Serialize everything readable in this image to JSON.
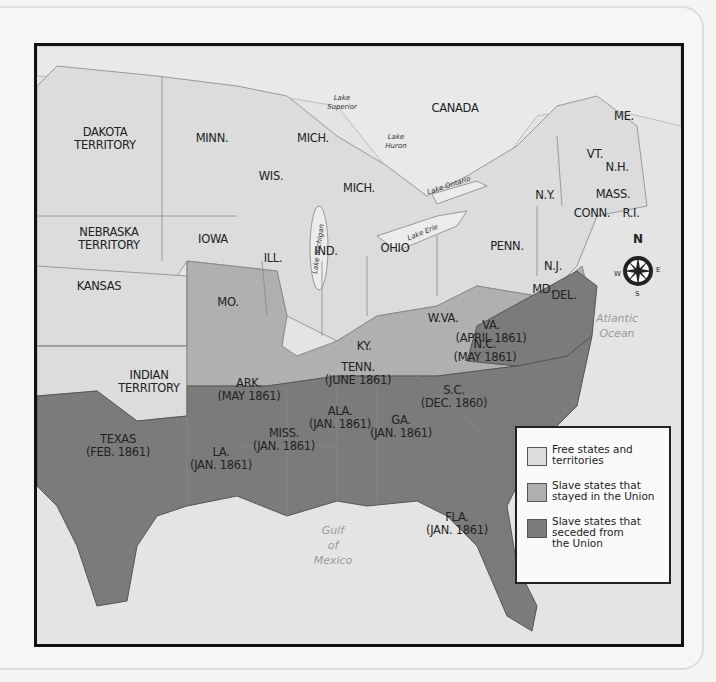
{
  "colors": {
    "free": "#dcdcdc",
    "slave_union": "#b0b0b0",
    "slave_seceded": "#7b7b7b",
    "water": "#e6e6e6",
    "canada": "#e8e8e8",
    "border": "#111111"
  },
  "labels": {
    "canada": "CANADA",
    "dakota": "DAKOTA\nTERRITORY",
    "minn": "MINN.",
    "mich_upper": "MICH.",
    "mich_lower": "MICH.",
    "wis": "WIS.",
    "nebraska": "NEBRASKA\nTERRITORY",
    "iowa": "IOWA",
    "ill": "ILL.",
    "ind": "IND.",
    "ohio": "OHIO",
    "penn": "PENN.",
    "ny": "N.Y.",
    "vt": "VT.",
    "nh": "N.H.",
    "me": "ME.",
    "mass": "MASS.",
    "conn": "CONN.",
    "ri": "R.I.",
    "nj": "N.J.",
    "del": "DEL.",
    "md": "MD.",
    "kansas": "KANSAS",
    "mo": "MO.",
    "ky": "KY.",
    "wva": "W.VA.",
    "va": "VA.\n(APRIL 1861)",
    "nc": "N.C.\n(MAY 1861)",
    "tenn": "TENN.\n(JUNE 1861)",
    "ark": "ARK.\n(MAY 1861)",
    "indian": "INDIAN\nTERRITORY",
    "sc": "S.C.\n(DEC. 1860)",
    "ala": "ALA.\n(JAN. 1861)",
    "ga": "GA.\n(JAN. 1861)",
    "miss": "MISS.\n(JAN. 1861)",
    "texas": "TEXAS\n(FEB. 1861)",
    "la": "LA.\n(JAN. 1861)",
    "fla": "FLA.\n(JAN. 1861)"
  },
  "water_labels": {
    "atlantic": "Atlantic Ocean",
    "gulf": "Gulf\nof\nMexico",
    "lake_superior": "Lake\nSuperior",
    "lake_michigan": "Lake Michigan",
    "lake_huron": "Lake\nHuron",
    "lake_ontario": "Lake Ontario",
    "lake_erie": "Lake Erie"
  },
  "compass": {
    "n": "N",
    "s": "S",
    "e": "E",
    "w": "W"
  },
  "legend": {
    "items": [
      {
        "label": "Free states and\nterritories",
        "color": "#dcdcdc"
      },
      {
        "label": "Slave states that\nstayed in the Union",
        "color": "#b0b0b0"
      },
      {
        "label": "Slave states that\nseceded from\nthe Union",
        "color": "#7b7b7b"
      }
    ]
  }
}
